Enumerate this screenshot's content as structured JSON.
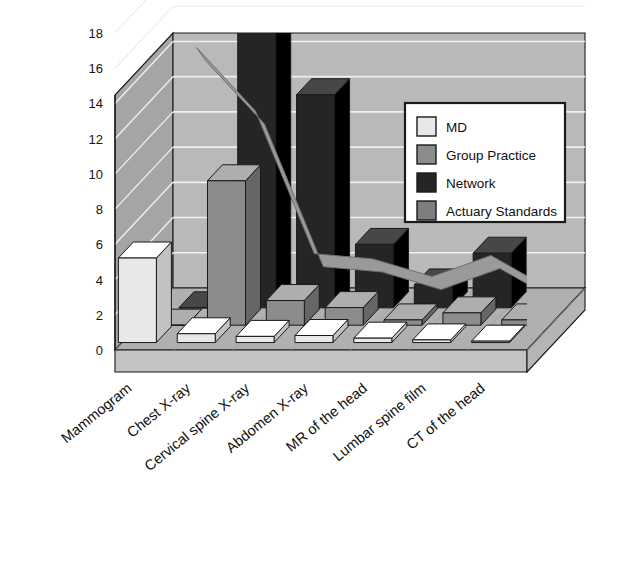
{
  "chart_data": {
    "type": "bar",
    "render": "3d-grouped-bar-with-line",
    "title": "",
    "subtitle": "",
    "xlabel": "",
    "ylabel": "",
    "ylim": [
      0,
      18
    ],
    "ytick_step": 2,
    "yticks": [
      0,
      2,
      4,
      6,
      8,
      10,
      12,
      14,
      16,
      18
    ],
    "ytick_labels": [
      "0",
      "2",
      "4",
      "6",
      "8",
      "10",
      "12",
      "14",
      "16",
      "18"
    ],
    "grid": true,
    "grid_axis": "y",
    "legend_position": "top-right",
    "categories": [
      "Mammogram",
      "Chest X-ray",
      "Cervical spine X-ray",
      "Abdomen X-ray",
      "MR of the head",
      "Lumbar spine film",
      "CT of the head"
    ],
    "series": [
      {
        "name": "MD",
        "color": "#e8e8e8",
        "render": "bar",
        "values": [
          4.8,
          0.5,
          0.35,
          0.4,
          0.25,
          0.15,
          0.08
        ]
      },
      {
        "name": "Group Practice",
        "color": "#8c8c8c",
        "render": "bar",
        "values": [
          0.0,
          8.2,
          1.4,
          1.0,
          0.3,
          0.7,
          0.3
        ]
      },
      {
        "name": "Network",
        "color": "#252525",
        "render": "bar",
        "values": [
          0.0,
          18.4,
          12.1,
          3.6,
          1.3,
          3.1,
          0.6
        ]
      },
      {
        "name": "Actuary Standards",
        "color": "#9a9a9a",
        "render": "line",
        "values": [
          14.0,
          10.4,
          2.3,
          2.0,
          1.0,
          2.2,
          0.3
        ]
      }
    ]
  },
  "legend": {
    "entries": [
      {
        "label": "MD",
        "swatch": "#e8e8e8"
      },
      {
        "label": "Group Practice",
        "swatch": "#8c8c8c"
      },
      {
        "label": "Network",
        "swatch": "#252525"
      },
      {
        "label": "Actuary Standards",
        "swatch": "#7e7e7e"
      }
    ]
  },
  "colors": {
    "plot_back_wall": "#b9b9b9",
    "plot_side_wall": "#a5a5a5",
    "plot_floor": "#b0b0b0",
    "floor_front": "#c4c4c4",
    "gridline": "#efefef",
    "outline": "#1a1a1a",
    "page_background": "#ffffff",
    "text": "#101010"
  }
}
